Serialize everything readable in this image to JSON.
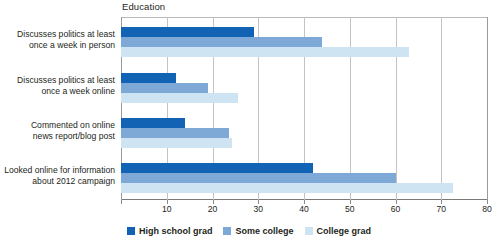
{
  "chart_data": {
    "type": "bar",
    "orientation": "horizontal",
    "title": "Education",
    "xlabel": "",
    "ylabel": "",
    "xlim": [
      0,
      80
    ],
    "xticks": [
      0,
      10,
      20,
      30,
      40,
      50,
      60,
      70,
      80
    ],
    "xtick_labels": [
      "",
      "10",
      "20",
      "30",
      "40",
      "50",
      "60",
      "70",
      "80"
    ],
    "grid": true,
    "legend_position": "bottom-center",
    "categories": [
      "Discusses politics at least once a week in person",
      "Discusses politics at least once a week online",
      "Commented on online news report/blog post",
      "Looked online for information about 2012 campaign"
    ],
    "category_lines": [
      [
        "Discusses politics at least",
        "once a week in person"
      ],
      [
        "Discusses politics at least",
        "once a week online"
      ],
      [
        "Commented on online",
        "news report/blog post"
      ],
      [
        "Looked online for information",
        "about 2012 campaign"
      ]
    ],
    "series": [
      {
        "name": "High school grad",
        "color": "#1363b4",
        "values": [
          29,
          12,
          14,
          42
        ]
      },
      {
        "name": "Some college",
        "color": "#7ea9d6",
        "values": [
          44,
          19,
          23.5,
          60
        ]
      },
      {
        "name": "College grad",
        "color": "#cfe4f3",
        "values": [
          63,
          25.5,
          24.3,
          72.5
        ]
      }
    ]
  },
  "legend": {
    "items": [
      {
        "label": "High school grad",
        "color": "#1363b4"
      },
      {
        "label": "Some college",
        "color": "#7ea9d6"
      },
      {
        "label": "College grad",
        "color": "#cfe4f3"
      }
    ]
  }
}
